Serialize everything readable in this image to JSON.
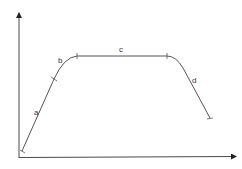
{
  "diagram": {
    "type": "curve-on-axes",
    "colors": {
      "axis": "#4a4a4a",
      "curve": "#555555",
      "background": "#ffffff"
    },
    "segments": [
      {
        "id": "a",
        "label": "a",
        "description": "steep linear rise"
      },
      {
        "id": "b",
        "label": "b",
        "description": "rounded knee leveling off"
      },
      {
        "id": "c",
        "label": "c",
        "description": "flat plateau"
      },
      {
        "id": "d",
        "label": "d",
        "description": "curved decline"
      }
    ],
    "axes": {
      "x_label": "",
      "y_label": ""
    }
  }
}
